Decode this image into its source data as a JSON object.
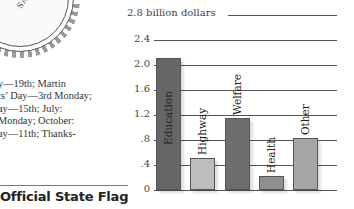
{
  "left_panel": {
    "seal_text": "SA",
    "holiday_lines": [
      "y—19th; Martin",
      "ts’ Day—3rd Monday;",
      "ay—15th; July:",
      "Monday; October:",
      "ay—11th; Thanks-"
    ],
    "flag_title": "Official State Flag"
  },
  "chart_data": {
    "type": "bar",
    "title": "",
    "xlabel": "",
    "ylabel": "billion dollars",
    "unit_label": "2.8 billion dollars",
    "categories": [
      "Education",
      "Highway",
      "Welfare",
      "Health",
      "Other"
    ],
    "values": [
      2.1,
      0.5,
      1.15,
      0.22,
      0.82
    ],
    "y_ticks": [
      "0",
      ".4",
      ".8",
      "1.2",
      "1.6",
      "2.0",
      "2.4",
      "2.8"
    ],
    "ylim": [
      0,
      2.8
    ],
    "grid": true,
    "legend": "none",
    "colors": [
      "#666666",
      "#bdbdbd",
      "#6e6e6e",
      "#8f8f8f",
      "#a6a6a6"
    ]
  }
}
